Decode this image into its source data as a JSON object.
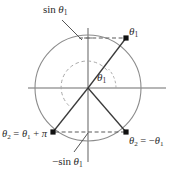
{
  "figure": {
    "kind": "unit-circle-trigonometry-diagram",
    "background_color": "#ffffff",
    "colors": {
      "outer_circle": "#8c8c8c",
      "inner_arc": "#a8a8a8",
      "axis": "#6e6e6e",
      "radius_line": "#3a3a3a",
      "dashed_guide": "#5a5a5a",
      "point_marker": "#111111",
      "leader_line": "#555555",
      "text": "#2b2b2b"
    },
    "geometry": {
      "origin": {
        "x": 88,
        "y": 88
      },
      "outer_radius": 53,
      "inner_arc_radius": 26,
      "angle_theta1_degrees": 43,
      "points": {
        "theta1": {
          "x": 126,
          "y": 38
        },
        "theta1_plus_pi": {
          "x": 53,
          "y": 132
        },
        "minus_theta1": {
          "x": 126,
          "y": 132
        }
      },
      "axis_x_extent": [
        28,
        166
      ],
      "axis_y_extent": [
        28,
        162
      ]
    }
  },
  "labels": {
    "sin_theta1_top": {
      "prefix": "sin ",
      "symbol": "θ",
      "sub": "1"
    },
    "theta1_point": {
      "symbol": "θ",
      "sub": "1"
    },
    "theta1_angle": {
      "symbol": "θ",
      "sub": "1"
    },
    "theta2_plus_pi": {
      "text": "θ₂ = θ₁ + π"
    },
    "theta2_negative": {
      "text": "θ₂ = −θ₁"
    },
    "minus_sin_theta1_bottom": {
      "prefix": "−sin ",
      "symbol": "θ",
      "sub": "1"
    }
  },
  "label_text": {
    "sin_top_prefix": "sin",
    "sin_bottom_prefix": "−sin",
    "theta": "θ",
    "sub_one": "1",
    "sub_two": "2",
    "equals": "=",
    "plus": "+",
    "pi": "π",
    "minus": "−"
  }
}
